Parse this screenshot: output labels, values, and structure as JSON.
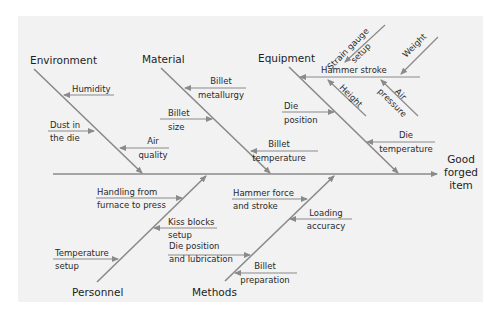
{
  "diagram": {
    "type": "fishbone",
    "effect": {
      "lines": [
        "Good",
        "forged",
        "item"
      ]
    },
    "categories": {
      "environment": "Environment",
      "material": "Material",
      "equipment": "Equipment",
      "personnel": "Personnel",
      "methods": "Methods"
    },
    "causes": {
      "environment": [
        {
          "lines": [
            "Humidity"
          ]
        },
        {
          "lines": [
            "Dust in",
            "the die"
          ]
        },
        {
          "lines": [
            "Air",
            "quality"
          ]
        }
      ],
      "material": [
        {
          "lines": [
            "Billet",
            "metallurgy"
          ]
        },
        {
          "lines": [
            "Billet",
            "size"
          ]
        },
        {
          "lines": [
            "Billet",
            "temperature"
          ]
        }
      ],
      "equipment": [
        {
          "lines": [
            "Hammer stroke"
          ]
        },
        {
          "lines": [
            "Strain gauge",
            "setup"
          ]
        },
        {
          "lines": [
            "Weight"
          ]
        },
        {
          "lines": [
            "Height"
          ]
        },
        {
          "lines": [
            "Air",
            "pressure"
          ]
        },
        {
          "lines": [
            "Die",
            "position"
          ]
        },
        {
          "lines": [
            "Die",
            "temperature"
          ]
        }
      ],
      "personnel": [
        {
          "lines": [
            "Handling from",
            "furnace to press"
          ]
        },
        {
          "lines": [
            "Kiss blocks",
            "setup"
          ]
        },
        {
          "lines": [
            "Temperature",
            "setup"
          ]
        }
      ],
      "methods": [
        {
          "lines": [
            "Hammer force",
            "and stroke"
          ]
        },
        {
          "lines": [
            "Loading",
            "accuracy"
          ]
        },
        {
          "lines": [
            "Die position",
            "and lubrication"
          ]
        },
        {
          "lines": [
            "Billet",
            "preparation"
          ]
        }
      ]
    }
  }
}
